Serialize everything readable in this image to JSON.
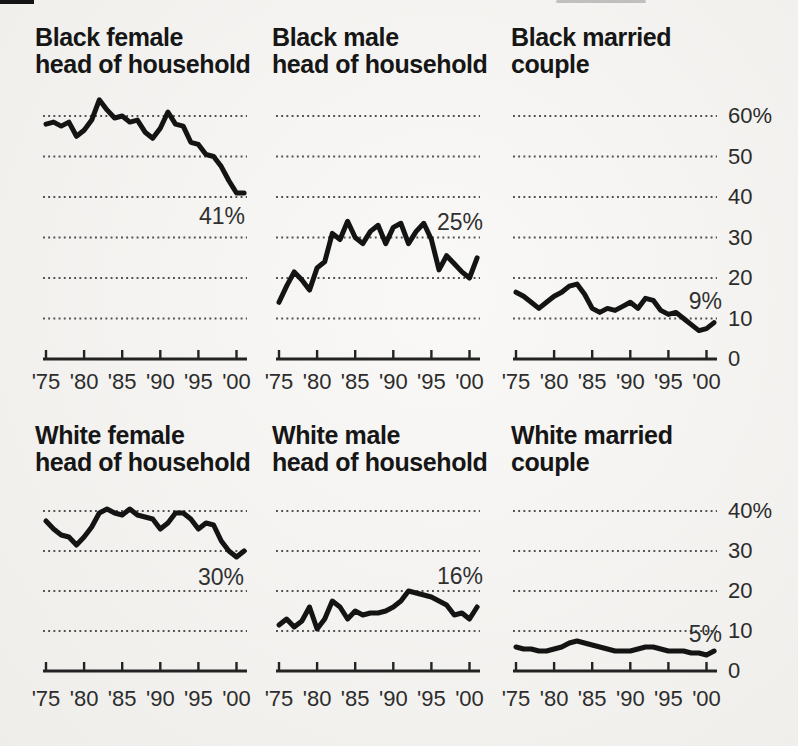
{
  "colors": {
    "paper": "#f6f5f2",
    "ink": "#161616",
    "label": "#2c2c2c",
    "grid": "#505050"
  },
  "axes": {
    "x_tick_labels": [
      "'75",
      "'80",
      "'85",
      "'90",
      "'95",
      "'00"
    ],
    "row1_y_labels": [
      "60%",
      "50",
      "40",
      "30",
      "20",
      "10",
      "0"
    ],
    "row2_y_labels": [
      "40%",
      "30",
      "20",
      "10",
      "0"
    ]
  },
  "charts": [
    {
      "title_line1": "Black female",
      "title_line2": "head of household",
      "end_label": "41%"
    },
    {
      "title_line1": "Black male",
      "title_line2": "head of household",
      "end_label": "25%"
    },
    {
      "title_line1": "Black married",
      "title_line2": "couple",
      "end_label": "9%"
    },
    {
      "title_line1": "White female",
      "title_line2": "head of household",
      "end_label": "30%"
    },
    {
      "title_line1": "White male",
      "title_line2": "head of household",
      "end_label": "16%"
    },
    {
      "title_line1": "White married",
      "title_line2": "couple",
      "end_label": "5%"
    }
  ],
  "chart_data": [
    {
      "type": "line",
      "title": "Black female head of household",
      "end_label": "41%",
      "x_start": 1975,
      "x_step": 1,
      "x_tick_labels": [
        "'75",
        "'80",
        "'85",
        "'90",
        "'95",
        "'00"
      ],
      "ylim": [
        0,
        65
      ],
      "yticks": [
        0,
        10,
        20,
        30,
        40,
        50,
        60
      ],
      "grid": "dotted-horizontal",
      "legend": "none",
      "values": [
        58,
        58.5,
        57.5,
        58.5,
        55,
        56.5,
        59,
        64,
        61.5,
        59.5,
        60,
        58.5,
        59,
        56,
        54.5,
        57,
        61,
        58,
        57.5,
        53.5,
        53,
        50.5,
        50,
        47.5,
        44,
        41,
        41
      ]
    },
    {
      "type": "line",
      "title": "Black male head of household",
      "end_label": "25%",
      "x_start": 1975,
      "x_step": 1,
      "x_tick_labels": [
        "'75",
        "'80",
        "'85",
        "'90",
        "'95",
        "'00"
      ],
      "ylim": [
        0,
        65
      ],
      "yticks": [
        0,
        10,
        20,
        30,
        40,
        50,
        60
      ],
      "grid": "dotted-horizontal",
      "legend": "none",
      "values": [
        14,
        18,
        21.5,
        19.5,
        17,
        22.5,
        24,
        31,
        29.5,
        34,
        30,
        28.5,
        31.5,
        33,
        28.5,
        32.5,
        33.5,
        28.5,
        31.5,
        33.5,
        29.5,
        22,
        25.5,
        23.5,
        21.5,
        20,
        25
      ]
    },
    {
      "type": "line",
      "title": "Black married couple",
      "end_label": "9%",
      "x_start": 1975,
      "x_step": 1,
      "x_tick_labels": [
        "'75",
        "'80",
        "'85",
        "'90",
        "'95",
        "'00"
      ],
      "ylim": [
        0,
        65
      ],
      "yticks": [
        0,
        10,
        20,
        30,
        40,
        50,
        60
      ],
      "grid": "dotted-horizontal",
      "legend": "none",
      "values": [
        16.5,
        15.5,
        14,
        12.5,
        14,
        15.5,
        16.5,
        18,
        18.5,
        16,
        12.5,
        11.5,
        12.5,
        12,
        13,
        14,
        12.5,
        15,
        14.5,
        12,
        11,
        11.5,
        10,
        8.5,
        7,
        7.5,
        9
      ]
    },
    {
      "type": "line",
      "title": "White female head of household",
      "end_label": "30%",
      "x_start": 1975,
      "x_step": 1,
      "x_tick_labels": [
        "'75",
        "'80",
        "'85",
        "'90",
        "'95",
        "'00"
      ],
      "ylim": [
        0,
        48
      ],
      "yticks": [
        0,
        10,
        20,
        30,
        40
      ],
      "grid": "dotted-horizontal",
      "legend": "none",
      "values": [
        37.5,
        35.5,
        34,
        33.5,
        31.5,
        33.5,
        36,
        39.5,
        40.5,
        39.5,
        39,
        40.5,
        39,
        38.5,
        38,
        35.5,
        37,
        39.5,
        39.5,
        38,
        35.5,
        37,
        36.5,
        32.5,
        30,
        28.5,
        30
      ]
    },
    {
      "type": "line",
      "title": "White male head of household",
      "end_label": "16%",
      "x_start": 1975,
      "x_step": 1,
      "x_tick_labels": [
        "'75",
        "'80",
        "'85",
        "'90",
        "'95",
        "'00"
      ],
      "ylim": [
        0,
        48
      ],
      "yticks": [
        0,
        10,
        20,
        30,
        40
      ],
      "grid": "dotted-horizontal",
      "legend": "none",
      "values": [
        11.5,
        13,
        11,
        12.5,
        16,
        10.5,
        13,
        17.5,
        16,
        13,
        15,
        14,
        14.5,
        14.5,
        15,
        16,
        17.5,
        20,
        19.5,
        19,
        18.5,
        17.5,
        16.5,
        14,
        14.5,
        13,
        16
      ]
    },
    {
      "type": "line",
      "title": "White married couple",
      "end_label": "5%",
      "x_start": 1975,
      "x_step": 1,
      "x_tick_labels": [
        "'75",
        "'80",
        "'85",
        "'90",
        "'95",
        "'00"
      ],
      "ylim": [
        0,
        48
      ],
      "yticks": [
        0,
        10,
        20,
        30,
        40
      ],
      "grid": "dotted-horizontal",
      "legend": "none",
      "values": [
        6,
        5.5,
        5.5,
        5,
        5,
        5.5,
        6,
        7,
        7.5,
        7,
        6.5,
        6,
        5.5,
        5,
        5,
        5,
        5.5,
        6,
        6,
        5.5,
        5,
        5,
        5,
        4.5,
        4.5,
        4,
        5
      ]
    }
  ]
}
